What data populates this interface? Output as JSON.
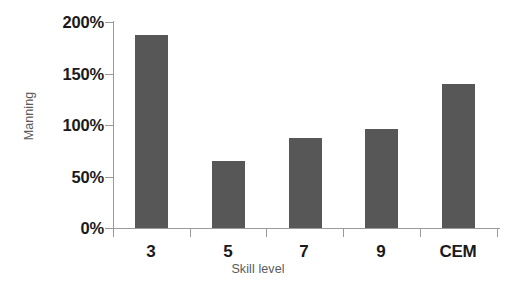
{
  "chart_data": {
    "type": "bar",
    "title": "",
    "xlabel": "Skill level",
    "ylabel": "Manning",
    "categories": [
      "3",
      "5",
      "7",
      "9",
      "CEM"
    ],
    "values": [
      187,
      65,
      87,
      96,
      140
    ],
    "value_unit": "%",
    "ylim": [
      0,
      200
    ],
    "ytick_values": [
      0,
      50,
      100,
      150,
      200
    ],
    "ytick_labels": [
      "0%",
      "50%",
      "100%",
      "150%",
      "200%"
    ],
    "grid": false,
    "legend": null,
    "series": [
      {
        "name": "Manning",
        "values": [
          187,
          65,
          87,
          96,
          140
        ]
      }
    ],
    "bar_color": "#575757",
    "axis_color": "#9a9a9a",
    "label_color": "#1a1a1a",
    "axis_title_color": "#5a5a5a",
    "background": "#ffffff"
  }
}
